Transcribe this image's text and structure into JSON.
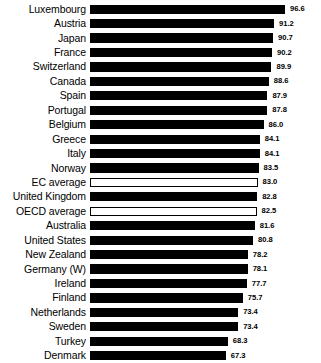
{
  "chart_data": {
    "type": "bar",
    "orientation": "horizontal",
    "title": "",
    "subtitle": "",
    "xlabel": "",
    "ylabel": "",
    "grid": false,
    "legend": null,
    "xlim": [
      0,
      96.6
    ],
    "axis_ticks_visible": false,
    "value_label_format": "one-decimal",
    "categories": [
      "Luxembourg",
      "Austria",
      "Japan",
      "France",
      "Switzerland",
      "Canada",
      "Spain",
      "Portugal",
      "Belgium",
      "Greece",
      "Italy",
      "Norway",
      "EC average",
      "United Kingdom",
      "OECD average",
      "Australia",
      "United States",
      "New Zealand",
      "Germany (W)",
      "Ireland",
      "Finland",
      "Netherlands",
      "Sweden",
      "Turkey",
      "Denmark"
    ],
    "values": [
      96.6,
      91.2,
      90.7,
      90.2,
      89.9,
      88.6,
      87.9,
      87.8,
      86.0,
      84.1,
      84.1,
      83.5,
      83.0,
      82.8,
      82.5,
      81.6,
      80.8,
      78.2,
      78.1,
      77.7,
      75.7,
      73.4,
      73.4,
      68.3,
      67.3
    ],
    "value_labels": [
      "96.6",
      "91.2",
      "90.7",
      "90.2",
      "89.9",
      "88.6",
      "87.9",
      "87.8",
      "86.0",
      "84.1",
      "84.1",
      "83.5",
      "83.0",
      "82.8",
      "82.5",
      "81.6",
      "80.8",
      "78.2",
      "78.1",
      "77.7",
      "75.7",
      "73.4",
      "73.4",
      "68.3",
      "67.3"
    ],
    "highlight_style": {
      "filled_color": "#000000",
      "hollow_color": "#ffffff",
      "hollow_outline": "#000000"
    },
    "hollow_categories": [
      "EC average",
      "OECD average"
    ]
  }
}
